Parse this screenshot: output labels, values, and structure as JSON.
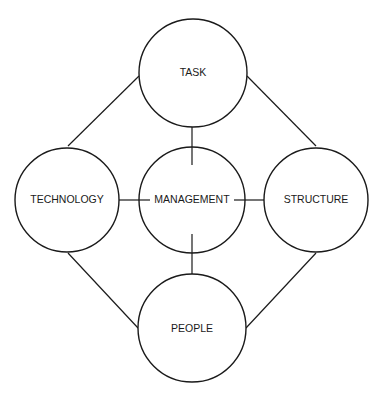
{
  "diagram": {
    "type": "relationship-diagram",
    "nodes": [
      {
        "id": "task",
        "label": "TASK"
      },
      {
        "id": "technology",
        "label": "TECHNOLOGY"
      },
      {
        "id": "management",
        "label": "MANAGEMENT"
      },
      {
        "id": "structure",
        "label": "STRUCTURE"
      },
      {
        "id": "people",
        "label": "PEOPLE"
      }
    ],
    "edges": [
      {
        "from": "task",
        "to": "technology"
      },
      {
        "from": "task",
        "to": "structure"
      },
      {
        "from": "task",
        "to": "management"
      },
      {
        "from": "technology",
        "to": "management"
      },
      {
        "from": "management",
        "to": "structure"
      },
      {
        "from": "management",
        "to": "people"
      },
      {
        "from": "technology",
        "to": "people"
      },
      {
        "from": "structure",
        "to": "people"
      }
    ],
    "colors": {
      "stroke": "#1a1a1a",
      "fill": "#ffffff",
      "background": "#ffffff"
    }
  }
}
